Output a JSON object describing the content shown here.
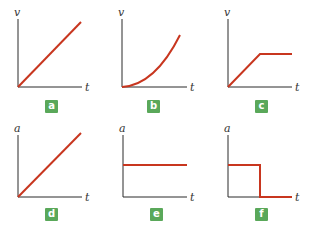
{
  "colors": {
    "curve": "#c8361f",
    "axis": "#2a2a2a",
    "badge": "#5aa85a"
  },
  "panels": [
    {
      "id": "a",
      "badge": "a",
      "y_label": "v",
      "x_label": "t",
      "shape": "linear increasing from origin"
    },
    {
      "id": "b",
      "badge": "b",
      "y_label": "v",
      "x_label": "t",
      "shape": "parabolic increasing from origin"
    },
    {
      "id": "c",
      "badge": "c",
      "y_label": "v",
      "x_label": "t",
      "shape": "linear increase then constant"
    },
    {
      "id": "d",
      "badge": "d",
      "y_label": "a",
      "x_label": "t",
      "shape": "linear increasing from origin"
    },
    {
      "id": "e",
      "badge": "e",
      "y_label": "a",
      "x_label": "t",
      "shape": "constant nonzero"
    },
    {
      "id": "f",
      "badge": "f",
      "y_label": "a",
      "x_label": "t",
      "shape": "constant then step drop to zero"
    }
  ]
}
